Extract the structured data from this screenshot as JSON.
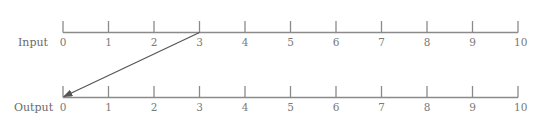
{
  "diagram": {
    "type": "number-line-mapping",
    "colors": {
      "axis": "#8a8a8a",
      "arrow": "#555555",
      "text": "#6b6b6b"
    },
    "input": {
      "label": "Input",
      "ticks": [
        "0",
        "1",
        "2",
        "3",
        "4",
        "5",
        "6",
        "7",
        "8",
        "9",
        "10"
      ]
    },
    "output": {
      "label": "Output",
      "ticks": [
        "0",
        "1",
        "2",
        "3",
        "4",
        "5",
        "6",
        "7",
        "8",
        "9",
        "10"
      ]
    },
    "mapping": {
      "from_input": 3,
      "to_output": 0
    }
  }
}
